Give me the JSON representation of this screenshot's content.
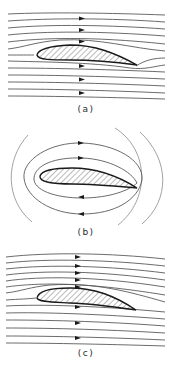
{
  "figure": {
    "colors": {
      "streamline": "#5a5a5a",
      "airfoil_outline": "#1a1a1a",
      "hatch": "#777777",
      "background": "#ffffff"
    },
    "panels": [
      {
        "id": "a",
        "label": "(a)",
        "flow_type": "uniform flow without circulation",
        "streamline_count": 13,
        "arrow_direction": "right"
      },
      {
        "id": "b",
        "label": "(b)",
        "flow_type": "pure circulation around airfoil",
        "closed_loops": 2,
        "open_arcs": 3,
        "arrow_direction_top": "right",
        "arrow_direction_bottom": "left"
      },
      {
        "id": "c",
        "label": "(c)",
        "flow_type": "uniform flow plus circulation",
        "streamline_count": 14,
        "arrow_direction": "right"
      }
    ],
    "caption": ""
  }
}
